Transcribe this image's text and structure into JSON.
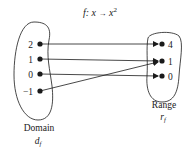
{
  "title": {
    "f": "f",
    "colon_x": ": x ",
    "arrow": "→",
    "x": " x",
    "sup": "2"
  },
  "domain": {
    "label": "Domain",
    "symbol": "d",
    "symbol_sub": "f",
    "elements": [
      {
        "label": "2",
        "maps_to": "4"
      },
      {
        "label": "1",
        "maps_to": "1"
      },
      {
        "label": "0",
        "maps_to": "0"
      },
      {
        "label": "−1",
        "maps_to": "1"
      }
    ]
  },
  "range": {
    "label": "Range",
    "symbol": "r",
    "symbol_sub": "f",
    "elements": [
      {
        "label": "4"
      },
      {
        "label": "1"
      },
      {
        "label": "0"
      }
    ]
  },
  "colors": {
    "ink": "#1a1a1a",
    "background": "#ffffff"
  }
}
